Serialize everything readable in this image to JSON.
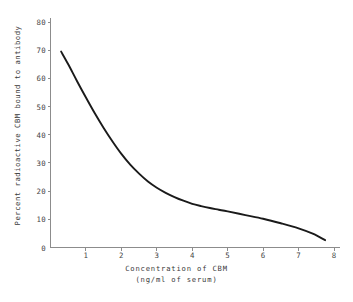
{
  "chart_data": {
    "type": "line",
    "title": "",
    "subtitle": "",
    "xlabel": "Concentration of CBM",
    "xlabel_line2": "(ng/ml of serum)",
    "ylabel": "Percent radioactive CBM bound to antibody",
    "xlim": [
      0,
      8.35
    ],
    "ylim": [
      0,
      84
    ],
    "grid": false,
    "legend": "none",
    "xticks": [
      "0",
      "1",
      "2",
      "3",
      "4",
      "5",
      "6",
      "7",
      "8"
    ],
    "xtick_values": [
      0,
      1,
      2,
      3,
      4,
      5,
      6,
      7,
      8
    ],
    "yticks": [
      "0",
      "10",
      "20",
      "30",
      "40",
      "50",
      "60",
      "70",
      "80"
    ],
    "ytick_values": [
      0,
      10,
      20,
      30,
      40,
      50,
      60,
      70,
      80
    ],
    "x": [
      0.3,
      0.5,
      0.75,
      1.0,
      1.25,
      1.5,
      1.75,
      2.0,
      2.25,
      2.5,
      2.75,
      3.0,
      3.25,
      3.5,
      3.75,
      4.0,
      4.25,
      4.5,
      4.75,
      5.0,
      5.5,
      6.0,
      6.5,
      7.0,
      7.4,
      7.75
    ],
    "values": [
      69.5,
      65.0,
      59.0,
      53.2,
      47.6,
      42.4,
      37.6,
      33.2,
      29.4,
      26.2,
      23.4,
      21.2,
      19.4,
      17.9,
      16.6,
      15.5,
      14.7,
      14.0,
      13.4,
      12.8,
      11.5,
      10.2,
      8.6,
      6.8,
      4.9,
      2.6
    ],
    "series": [
      {
        "name": "Percent radioactive CBM bound to antibody",
        "color": "#1a1a1a",
        "values": [
          69.5,
          65.0,
          59.0,
          53.2,
          47.6,
          42.4,
          37.6,
          33.2,
          29.4,
          26.2,
          23.4,
          21.2,
          19.4,
          17.9,
          16.6,
          15.5,
          14.7,
          14.0,
          13.4,
          12.8,
          11.5,
          10.2,
          8.6,
          6.8,
          4.9,
          2.6
        ]
      }
    ],
    "annotations": []
  },
  "style": {
    "axis_color": "#8c8c8c",
    "curve_color": "#1a1a1a",
    "text_color": "#3a3a3a",
    "background": "#ffffff"
  }
}
